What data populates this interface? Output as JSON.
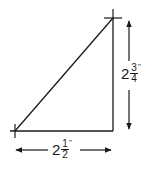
{
  "diagram": {
    "type": "right-triangle-dimension",
    "stroke_color": "#1a1a1a",
    "vertices": {
      "top_right": [
        113,
        18
      ],
      "bottom_left": [
        15,
        131
      ],
      "bottom_right": [
        113,
        131
      ]
    },
    "height_label": {
      "whole": "2",
      "numerator": "3",
      "denominator": "4",
      "unit": "\""
    },
    "width_label": {
      "whole": "2",
      "numerator": "1",
      "denominator": "2",
      "unit": "\""
    }
  }
}
